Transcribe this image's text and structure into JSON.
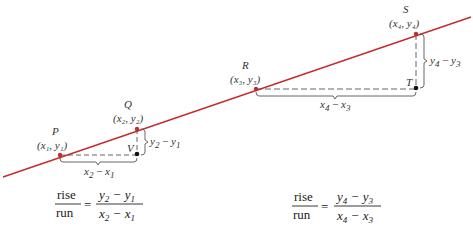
{
  "diagram": {
    "type": "slope-rise-run",
    "line_color": "#c62b2b",
    "line": {
      "x1": 3,
      "y1": 177,
      "x2": 471,
      "y2": 17
    },
    "points": [
      {
        "id": "P",
        "name": "P",
        "coord_label": "(x₁, y₁)",
        "x": 60,
        "y": 155,
        "color": "#c62b2b"
      },
      {
        "id": "Q",
        "name": "Q",
        "coord_label": "(x₂, y₂)",
        "x": 137,
        "y": 129,
        "color": "#c62b2b"
      },
      {
        "id": "R",
        "name": "R",
        "coord_label": "(x₃, y₃)",
        "x": 256,
        "y": 89,
        "color": "#c62b2b"
      },
      {
        "id": "S",
        "name": "S",
        "coord_label": "(x₄, y₄)",
        "x": 416,
        "y": 34,
        "color": "#c62b2b"
      },
      {
        "id": "V",
        "name": "V",
        "x": 137,
        "y": 154,
        "color": "#111111"
      },
      {
        "id": "T",
        "name": "T",
        "x": 416,
        "y": 88,
        "color": "#111111"
      }
    ],
    "run_labels": [
      {
        "text_main": "x",
        "sub1": "2",
        "minus": " − ",
        "text2": "x",
        "sub2": "1"
      },
      {
        "text_main": "x",
        "sub1": "4",
        "minus": " − ",
        "text2": "x",
        "sub2": "3"
      }
    ],
    "rise_labels": [
      {
        "text_main": "y",
        "sub1": "2",
        "minus": " − ",
        "text2": "y",
        "sub2": "1"
      },
      {
        "text_main": "y",
        "sub1": "4",
        "minus": " − ",
        "text2": "y",
        "sub2": "3"
      }
    ],
    "formulas": [
      {
        "numerator_word": "rise",
        "denominator_word": "run",
        "equals": "=",
        "num_a": "y",
        "num_a_sub": "2",
        "num_b": "y",
        "num_b_sub": "1",
        "den_a": "x",
        "den_a_sub": "2",
        "den_b": "x",
        "den_b_sub": "1",
        "minus": "−"
      },
      {
        "numerator_word": "rise",
        "denominator_word": "run",
        "equals": "=",
        "num_a": "y",
        "num_a_sub": "4",
        "num_b": "y",
        "num_b_sub": "3",
        "den_a": "x",
        "den_a_sub": "4",
        "den_b": "x",
        "den_b_sub": "3",
        "minus": "−"
      }
    ]
  }
}
